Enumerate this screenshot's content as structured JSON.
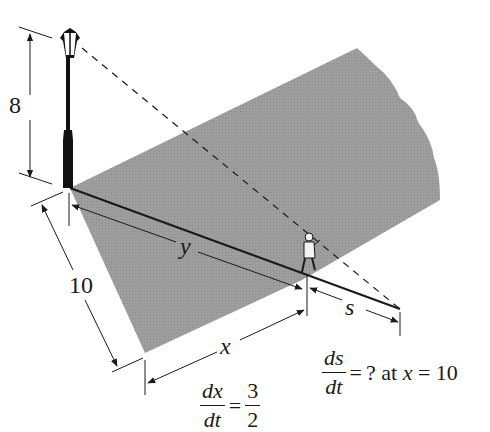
{
  "diagram": {
    "type": "related-rates-streetlight",
    "colors": {
      "shadow_fill": "#9a9a9a",
      "ink": "#1a1a1a",
      "background": "#ffffff"
    },
    "labels": {
      "lamp_height": "8",
      "side_distance": "10",
      "y_label": "y",
      "x_label": "x",
      "s_label": "s"
    },
    "equations": {
      "given": {
        "lhs_num": "dx",
        "lhs_den": "dt",
        "equals": "=",
        "rhs_num": "3",
        "rhs_den": "2"
      },
      "question": {
        "lhs_num": "ds",
        "lhs_den": "dt",
        "equals": "=",
        "rest_prefix": "? at ",
        "var": "x",
        "rest_suffix": " = 10"
      }
    }
  }
}
